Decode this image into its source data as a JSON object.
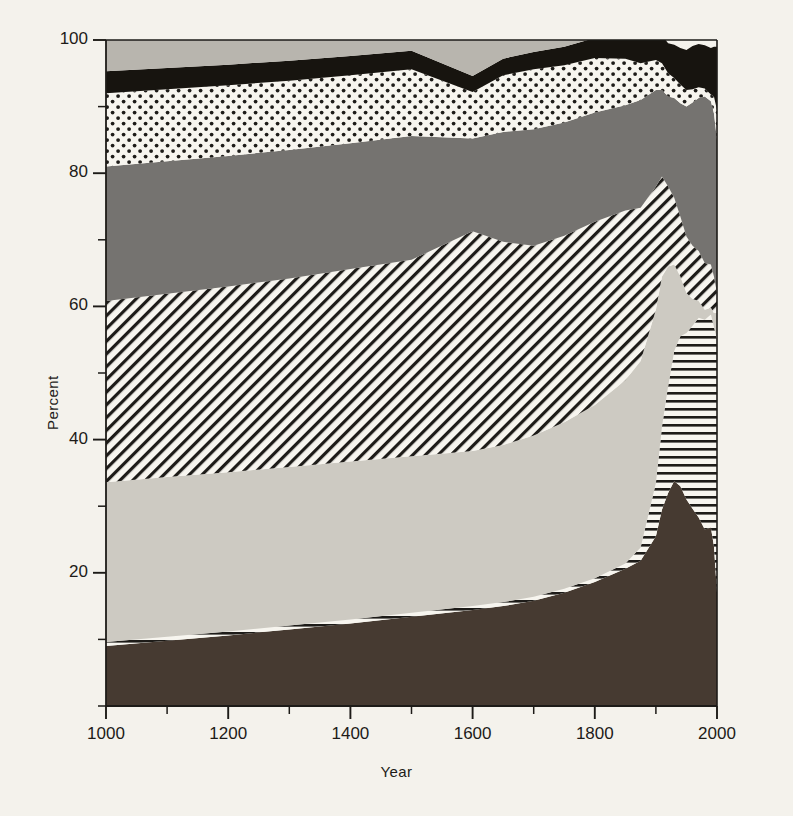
{
  "chart_data": {
    "type": "area",
    "title": "",
    "xlabel": "Year",
    "ylabel": "Percent",
    "xlim": [
      1000,
      2000
    ],
    "ylim": [
      0,
      100
    ],
    "stacked": true,
    "normalized_percent": true,
    "grid": false,
    "legend_position": "none",
    "xticks": [
      1000,
      1200,
      1400,
      1600,
      1800,
      2000
    ],
    "xtick_labels": [
      "1000",
      "1200",
      "1400",
      "1600",
      "1800",
      "2000"
    ],
    "xminor_step": 100,
    "yticks": [
      20,
      40,
      60,
      80,
      100
    ],
    "ytick_labels": [
      "20",
      "40",
      "60",
      "80",
      "100"
    ],
    "yminor_step": 10,
    "x": [
      1000,
      1100,
      1200,
      1300,
      1400,
      1500,
      1600,
      1650,
      1700,
      1750,
      1800,
      1850,
      1875,
      1900,
      1910,
      1920,
      1930,
      1940,
      1950,
      1960,
      1970,
      1980,
      1990,
      1995,
      2000
    ],
    "series": [
      {
        "name": "series-1",
        "pattern": "solid-dark-brown",
        "color": "#463a31",
        "values": [
          9.0,
          9.8,
          10.6,
          11.5,
          12.4,
          13.4,
          14.4,
          15.0,
          15.8,
          17.0,
          18.6,
          20.6,
          21.8,
          25.5,
          29.5,
          32.0,
          33.8,
          33.0,
          31.0,
          29.6,
          28.3,
          26.5,
          26.8,
          24.0,
          17.0
        ]
      },
      {
        "name": "series-2",
        "pattern": "horizontal-hatch",
        "color": "#ffffff",
        "values": [
          0.6,
          0.6,
          0.6,
          0.6,
          0.6,
          0.6,
          0.6,
          0.6,
          0.6,
          0.6,
          0.6,
          0.8,
          2.0,
          8.0,
          12.5,
          16.0,
          19.5,
          22.5,
          25.0,
          27.5,
          30.0,
          31.5,
          32.0,
          33.0,
          38.0
        ]
      },
      {
        "name": "series-3",
        "pattern": "solid-light-gray",
        "color": "#cdcac2",
        "values": [
          24.0,
          24.0,
          23.9,
          23.8,
          23.7,
          23.5,
          23.3,
          23.6,
          24.2,
          25.0,
          26.0,
          27.5,
          28.0,
          26.0,
          22.5,
          18.0,
          13.0,
          9.0,
          6.0,
          4.0,
          2.5,
          1.5,
          1.0,
          2.0,
          4.0
        ]
      },
      {
        "name": "series-4",
        "pattern": "diagonal-hatch",
        "color": "#ffffff",
        "values": [
          27.2,
          27.5,
          27.9,
          28.3,
          28.9,
          29.5,
          33.0,
          30.5,
          28.5,
          28.0,
          27.5,
          25.5,
          23.0,
          18.5,
          15.0,
          12.0,
          10.0,
          9.0,
          8.5,
          8.0,
          7.5,
          7.0,
          6.5,
          5.5,
          3.0
        ]
      },
      {
        "name": "series-5",
        "pattern": "solid-dark-gray",
        "color": "#757370",
        "values": [
          20.2,
          19.9,
          19.6,
          19.3,
          18.9,
          18.6,
          13.9,
          16.5,
          17.5,
          17.0,
          16.4,
          15.8,
          16.2,
          14.5,
          13.0,
          13.5,
          15.0,
          17.0,
          19.5,
          21.5,
          23.0,
          25.0,
          24.5,
          24.5,
          23.0
        ]
      },
      {
        "name": "series-6",
        "pattern": "dotted",
        "color": "#ffffff",
        "values": [
          11.0,
          10.8,
          10.6,
          10.4,
          10.2,
          10.0,
          7.0,
          8.5,
          9.0,
          8.6,
          8.2,
          7.0,
          5.5,
          4.5,
          4.0,
          3.5,
          3.0,
          2.8,
          2.5,
          2.0,
          1.6,
          1.2,
          1.0,
          2.5,
          4.5
        ]
      },
      {
        "name": "series-7",
        "pattern": "solid-black",
        "color": "#17140f",
        "values": [
          3.3,
          3.2,
          3.1,
          3.0,
          2.9,
          2.8,
          2.4,
          2.5,
          2.6,
          2.8,
          3.0,
          3.4,
          3.8,
          4.0,
          4.2,
          4.5,
          5.0,
          5.5,
          6.0,
          6.5,
          6.5,
          6.5,
          7.0,
          7.5,
          9.5
        ]
      },
      {
        "name": "series-8",
        "pattern": "solid-mid-light-gray",
        "color": "#b8b5ae",
        "values": [
          4.7,
          4.2,
          3.7,
          3.1,
          2.4,
          1.6,
          5.4,
          2.8,
          1.8,
          1.0,
          0.3,
          0.0,
          0.0,
          0.0,
          0.0,
          0.0,
          0.0,
          0.0,
          0.0,
          0.0,
          0.0,
          0.0,
          0.0,
          0.0,
          0.0
        ]
      }
    ],
    "colors": {
      "background": "#f4f2ec",
      "axis": "#1d1b18",
      "band_dark_brown": "#463a31",
      "band_light_gray": "#cdcac2",
      "band_dark_gray": "#757370",
      "band_mid_light_gray": "#b8b5ae",
      "band_black": "#17140f",
      "hatch_ink": "#1d1b18",
      "hatch_field": "#f7f5ef"
    }
  }
}
